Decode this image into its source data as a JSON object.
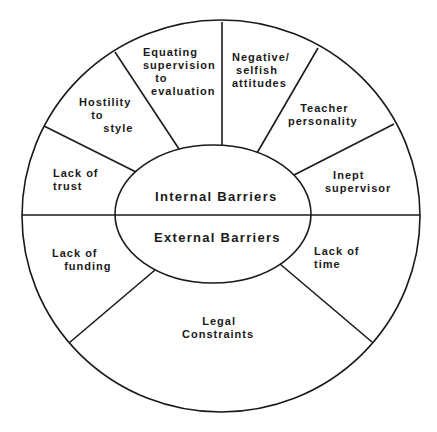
{
  "diagram": {
    "title": "",
    "center": {
      "top_label": "Internal Barriers",
      "bottom_label": "External Barriers"
    },
    "internal_barriers": [
      {
        "id": "lack-of-trust",
        "label": "Lack of\ntrust"
      },
      {
        "id": "hostility-to-style",
        "label": "Hostility\n   to\n      style"
      },
      {
        "id": "equating-supervision",
        "label": "Equating\nsupervision\n   to\n  evaluation"
      },
      {
        "id": "negative-attitudes",
        "label": "Negative/\n selfish\nattitudes"
      },
      {
        "id": "teacher-personality",
        "label": "   Teacher\npersonality"
      },
      {
        "id": "inept-supervisor",
        "label": "  Inept\nsupervisor"
      }
    ],
    "external_barriers": [
      {
        "id": "lack-of-funding",
        "label": "Lack of\n   funding"
      },
      {
        "id": "legal-constraints",
        "label": "     Legal\nConstraints"
      },
      {
        "id": "lack-of-time",
        "label": "Lack of\ntime"
      }
    ],
    "colors": {
      "line": "#1a1a1a",
      "background": "#ffffff",
      "text": "#1a1a1a"
    }
  }
}
